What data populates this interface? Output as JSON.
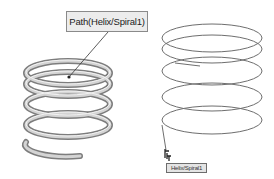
{
  "viewport": {
    "background": "#ffffff"
  },
  "left_model": {
    "type": "swept-spring",
    "callout_label": "Path(Helix/Spiral1)",
    "tube_color": "#a8a8a8",
    "tube_highlight": "#e8e8e8"
  },
  "right_model": {
    "type": "helix-curve",
    "curve_color": "#6a6a6a",
    "tooltip_label": "Helix/Spiral1"
  },
  "icons": {
    "cursor": "pointer-select-cursor"
  }
}
